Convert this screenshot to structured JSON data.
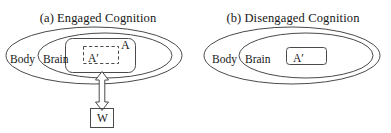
{
  "figure": {
    "background_color": "#ffffff",
    "stroke_color": "#4a4a4a",
    "text_color": "#161616"
  },
  "panels": [
    {
      "id": "engaged",
      "label_prefix": "(a)",
      "title": "Engaged Cognition",
      "regions": {
        "outer_ellipse_label": "Body",
        "inner_ellipse_label": "Brain",
        "rounded_box_label": "A",
        "dashed_box_label": "A′"
      },
      "external_node": {
        "label": "W"
      },
      "connector": {
        "type": "double-headed-hollow-arrow",
        "direction": "vertical"
      }
    },
    {
      "id": "disengaged",
      "label_prefix": "(b)",
      "title": "Disengaged Cognition",
      "regions": {
        "outer_ellipse_label": "Body",
        "inner_ellipse_label": "Brain",
        "rounded_box_label": "A′"
      }
    }
  ]
}
